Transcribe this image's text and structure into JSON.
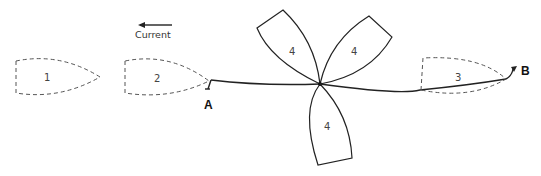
{
  "current": {
    "label": "Current",
    "direction": "left"
  },
  "points": {
    "a": "A",
    "b": "B"
  },
  "boats": [
    {
      "id": "boat-1",
      "label": "1",
      "style": "dashed"
    },
    {
      "id": "boat-2",
      "label": "2",
      "style": "dashed"
    },
    {
      "id": "boat-3",
      "label": "3",
      "style": "dashed"
    },
    {
      "id": "boat-4a",
      "label": "4",
      "style": "solid"
    },
    {
      "id": "boat-4b",
      "label": "4",
      "style": "solid"
    },
    {
      "id": "boat-4c",
      "label": "4",
      "style": "solid"
    }
  ],
  "colors": {
    "line": "#222222",
    "dashed": "#555555",
    "background": "#ffffff"
  }
}
